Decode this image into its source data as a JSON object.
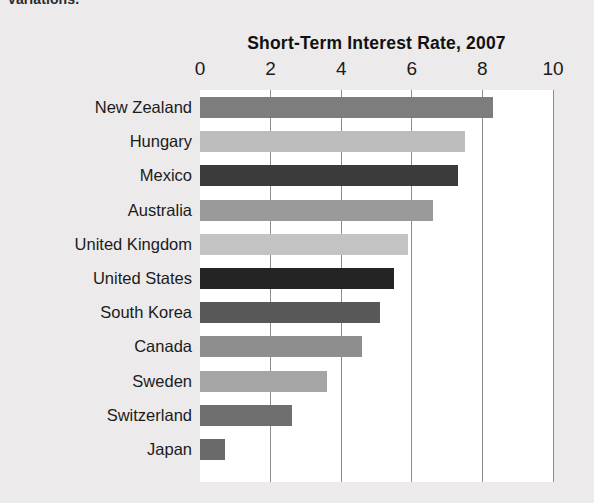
{
  "page": {
    "cutoff_text": "variations.",
    "background_color": "#eceaea",
    "plot_background_color": "#ffffff"
  },
  "chart_data": {
    "type": "bar",
    "orientation": "horizontal",
    "title": "Short-Term Interest Rate, 2007",
    "subtitle": "",
    "xlabel": "",
    "ylabel": "",
    "xlim": [
      0,
      10
    ],
    "ylim": null,
    "grid": true,
    "gridlines": "vertical",
    "legend": false,
    "legend_position": "none",
    "tick_labels": [
      "0",
      "2",
      "4",
      "6",
      "8",
      "10"
    ],
    "tick_values": [
      0,
      2,
      4,
      6,
      8,
      10
    ],
    "categories": [
      "New Zealand",
      "Hungary",
      "Mexico",
      "Australia",
      "United Kingdom",
      "United States",
      "South Korea",
      "Canada",
      "Sweden",
      "Switzerland",
      "Japan"
    ],
    "values": [
      8.3,
      7.5,
      7.3,
      6.6,
      5.9,
      5.5,
      5.1,
      4.6,
      3.6,
      2.6,
      0.7
    ],
    "bar_colors": [
      "#7d7d7d",
      "#bdbdbd",
      "#3b3b3b",
      "#9a9a9a",
      "#c3c3c3",
      "#242424",
      "#585858",
      "#8e8e8e",
      "#a5a5a5",
      "#6f6f6f",
      "#6a6a6a"
    ],
    "bars": [
      {
        "label": "New Zealand",
        "value": 8.3,
        "color": "#7d7d7d"
      },
      {
        "label": "Hungary",
        "value": 7.5,
        "color": "#bdbdbd"
      },
      {
        "label": "Mexico",
        "value": 7.3,
        "color": "#3b3b3b"
      },
      {
        "label": "Australia",
        "value": 6.6,
        "color": "#9a9a9a"
      },
      {
        "label": "United Kingdom",
        "value": 5.9,
        "color": "#c3c3c3"
      },
      {
        "label": "United States",
        "value": 5.5,
        "color": "#242424"
      },
      {
        "label": "South Korea",
        "value": 5.1,
        "color": "#585858"
      },
      {
        "label": "Canada",
        "value": 4.6,
        "color": "#8e8e8e"
      },
      {
        "label": "Sweden",
        "value": 3.6,
        "color": "#a5a5a5"
      },
      {
        "label": "Switzerland",
        "value": 2.6,
        "color": "#6f6f6f"
      },
      {
        "label": "Japan",
        "value": 0.7,
        "color": "#6a6a6a"
      }
    ]
  }
}
